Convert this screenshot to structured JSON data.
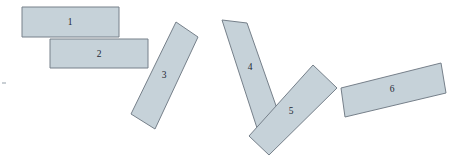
{
  "figure": {
    "name": "chain-of-blocks-diagram",
    "width": 457,
    "height": 168,
    "background_color": "#ffffff",
    "block_fill_color": "#c6d2d9",
    "block_stroke_color": "#76808a",
    "label_color": "#1c2733"
  },
  "blocks": [
    {
      "id": "block-1",
      "label": "1",
      "points": "22,7 119,7 119,37 22,37",
      "label_x": 70,
      "label_y": 23,
      "rotation_deg": 0
    },
    {
      "id": "block-2",
      "label": "2",
      "points": "50,39 148,39 148,68 50,68",
      "label_x": 99,
      "label_y": 55,
      "rotation_deg": 0
    },
    {
      "id": "block-3",
      "label": "3",
      "points": "176,22 198,37 155,129 131,114",
      "label_x": 164,
      "label_y": 76,
      "rotation_deg": 25
    },
    {
      "id": "block-4",
      "label": "4",
      "points": "222,20 247,23 281,120 257,128",
      "label_x": 250,
      "label_y": 68,
      "rotation_deg": -20
    },
    {
      "id": "block-5",
      "label": "5",
      "points": "313,65 337,88 269,155 249,136",
      "label_x": 291,
      "label_y": 112,
      "rotation_deg": -44
    },
    {
      "id": "block-6",
      "label": "6",
      "points": "341,88 441,63 446,93 345,117",
      "label_x": 392,
      "label_y": 90,
      "rotation_deg": -14
    }
  ],
  "specks": [
    {
      "id": "speck-left",
      "x": 2,
      "y": 82,
      "w": 4,
      "h": 2
    }
  ]
}
